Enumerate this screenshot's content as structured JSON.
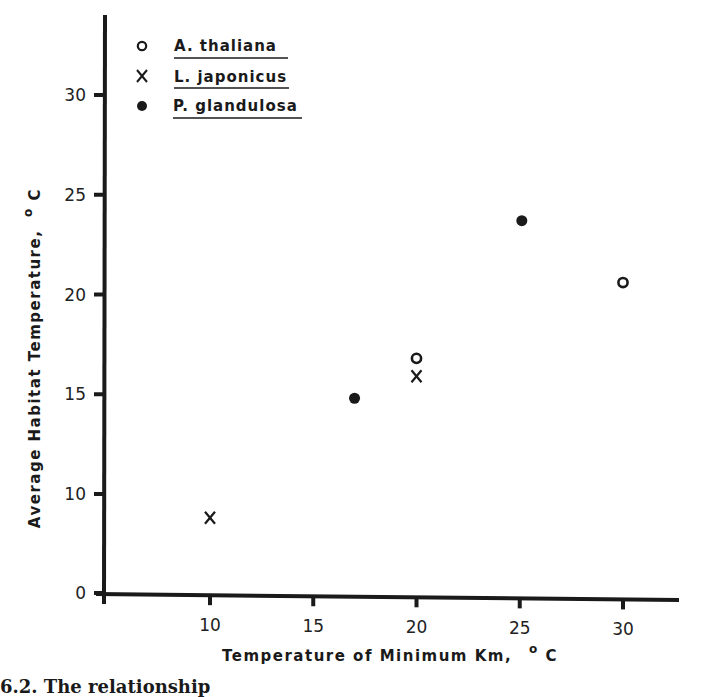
{
  "chart_data": {
    "type": "scatter",
    "title": "",
    "xlabel": "Temperature of Minimum Km, °C",
    "ylabel": "Average Habitat Temperature, °C",
    "xlim": [
      5,
      33
    ],
    "ylim": [
      0,
      33
    ],
    "x_ticks": [
      10,
      15,
      20,
      25,
      30
    ],
    "y_ticks": [
      0,
      10,
      15,
      20,
      25,
      30
    ],
    "axis_break_note": "y-axis jumps from 0 to 10 (0 drawn at the position 5 would occupy)",
    "grid": false,
    "legend_position": "upper-left",
    "series": [
      {
        "name": "A. thaliana",
        "marker": "open-circle",
        "points": [
          {
            "x": 20,
            "y": 16.8
          },
          {
            "x": 30,
            "y": 20.6
          }
        ]
      },
      {
        "name": "L. japonicus",
        "marker": "x",
        "points": [
          {
            "x": 10,
            "y": 8.8
          },
          {
            "x": 20,
            "y": 15.9
          }
        ]
      },
      {
        "name": "P. glandulosa",
        "marker": "filled-circle",
        "points": [
          {
            "x": 17,
            "y": 14.8
          },
          {
            "x": 25.1,
            "y": 23.7
          }
        ]
      }
    ]
  },
  "axes": {
    "x_title_main": "Temperature of Minimum Km,",
    "x_title_unit_sup": "o",
    "x_title_unit": "C",
    "y_title_main": "Average Habitat Temperature,",
    "y_title_unit_sup": "o",
    "y_title_unit": "C",
    "x_tick_labels": [
      "10",
      "15",
      "20",
      "25",
      "30"
    ],
    "y_tick_labels": [
      "0",
      "10",
      "15",
      "20",
      "25",
      "30"
    ]
  },
  "legend": {
    "items": [
      {
        "symbol": "o",
        "label": "A. thaliana"
      },
      {
        "symbol": "x",
        "label": "L. japonicus"
      },
      {
        "symbol": "•",
        "label": "P. glandulosa"
      }
    ]
  },
  "caption": {
    "text": "6.2.  The relationship"
  },
  "colors": {
    "ink": "#1a1a1a",
    "background": "#ffffff"
  }
}
